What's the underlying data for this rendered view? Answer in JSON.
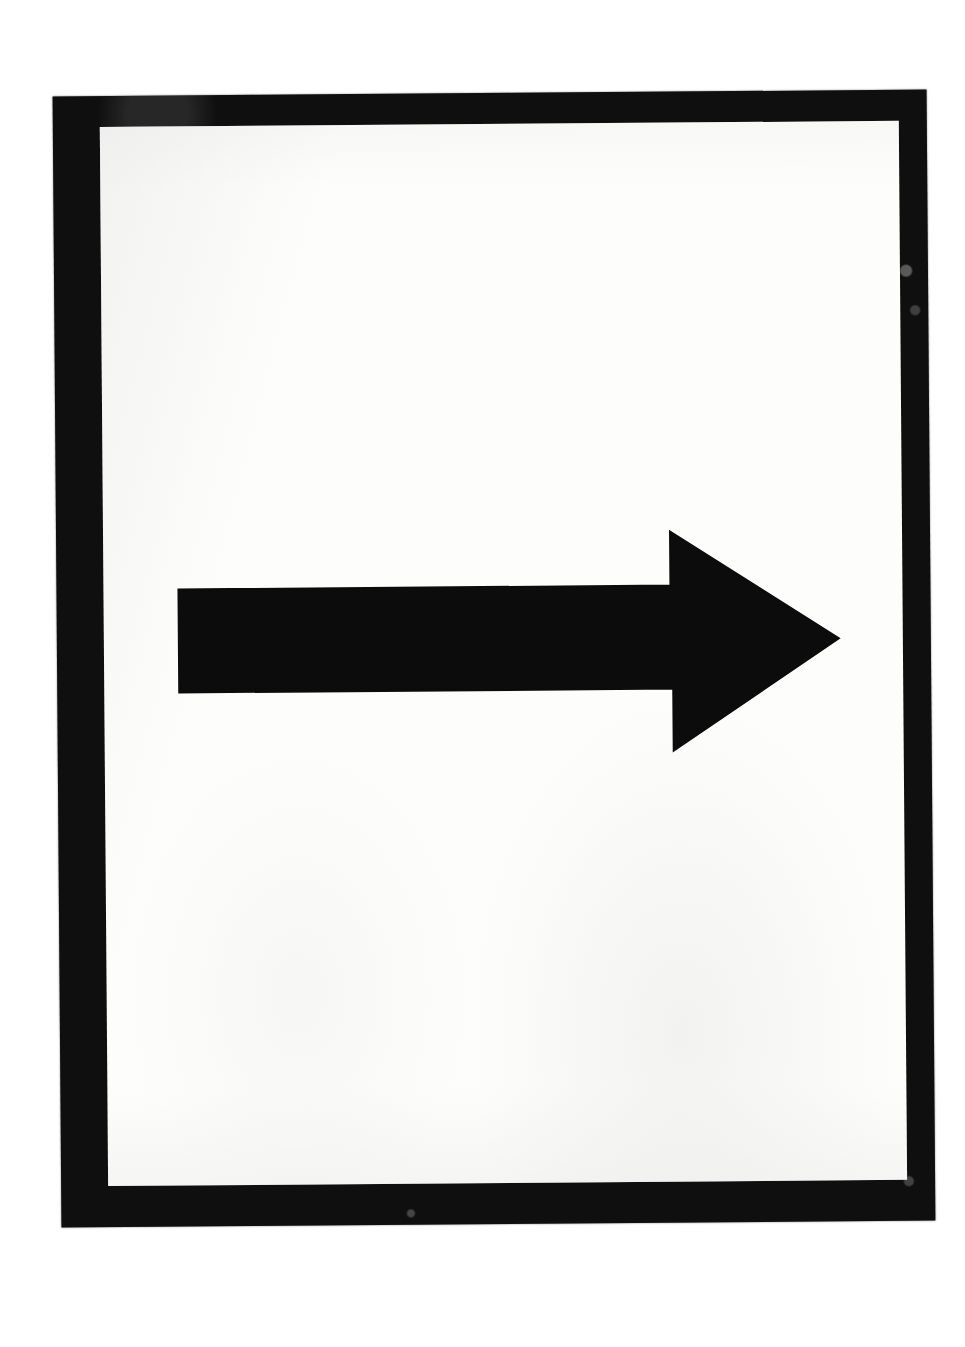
{
  "document": {
    "kind": "scanned-page",
    "title": "Right-pointing arrow sign",
    "page_background": "#ffffff",
    "page_width": 965,
    "page_height": 1347
  },
  "frame": {
    "name": "black-border-frame",
    "color": "#100f0f",
    "outer": {
      "x": 57,
      "y": 93,
      "width": 874,
      "height": 1131
    },
    "border_thickness": {
      "left": 47,
      "top": 31,
      "right": 28,
      "bottom": 41
    },
    "rotation_degrees": -0.45,
    "blemishes": [
      {
        "position": "right-border-upper",
        "tone": "light-gray"
      },
      {
        "position": "right-border-lower",
        "tone": "light-gray"
      },
      {
        "position": "bottom-border-center",
        "tone": "light-gray"
      }
    ]
  },
  "panel": {
    "name": "white-inner-panel",
    "color": "#fdfdfc",
    "bounds": {
      "x": 104,
      "y": 124,
      "width": 799,
      "height": 1059
    }
  },
  "arrow": {
    "name": "right-arrow",
    "direction": "right",
    "color": "#0d0c0c",
    "shaft": {
      "x1": 179,
      "y1": 587,
      "x2": 673,
      "y2": 690
    },
    "head": {
      "top_vertex": {
        "x": 671,
        "y": 533
      },
      "tip": {
        "x": 839,
        "y": 641
      },
      "bottom_vertex": {
        "x": 674,
        "y": 752
      }
    },
    "polygon_points": "179,587 671,587 671,533 839,641 673,752 673,690 179,690",
    "glyph": "→",
    "label": "Arrow pointing right"
  }
}
